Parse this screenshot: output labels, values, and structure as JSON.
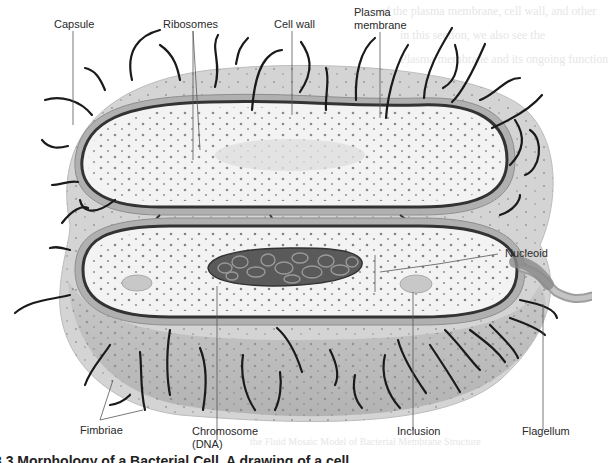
{
  "figure": {
    "title": "Morphology of a Bacterial Cell",
    "caption_visible_fragment": "3.3 Morphology of a Bacterial Cell. A drawing of a cell",
    "background_bleed_text": [
      "of the plasma membrane, cell wall, and other",
      "in this section, we also see the",
      "Plasma membrane and its ongoing function",
      "the Fluid Mosaic Model of Bacterial Membrane Structure"
    ]
  },
  "labels": {
    "capsule": "Capsule",
    "ribosomes": "Ribosomes",
    "cell_wall": "Cell wall",
    "plasma_membrane_1": "Plasma",
    "plasma_membrane_2": "membrane",
    "nucleoid": "Nucleoid",
    "fimbriae": "Fimbriae",
    "chromosome_1": "Chromosome",
    "chromosome_2": "(DNA)",
    "inclusion": "Inclusion",
    "flagellum": "Flagellum"
  },
  "colors": {
    "capsule_fill": "#d2d2d2",
    "cell_wall": "#a8a8a8",
    "membrane": "#3a3a3a",
    "cytoplasm": "#f2f2f2",
    "cut_surface": "#bdbdbd",
    "fimbriae": "#1a1a1a",
    "chromosome": "#4a4a4a",
    "leader_line": "#555555"
  }
}
